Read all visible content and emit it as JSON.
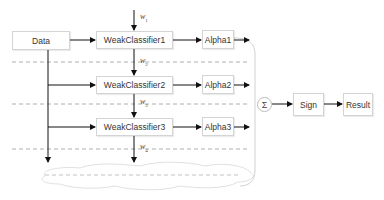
{
  "diagram": {
    "nodes": {
      "data": "Data",
      "weak1": "WeakClassifier1",
      "weak2": "WeakClassifier2",
      "weak3": "WeakClassifier3",
      "alpha1": "Alpha1",
      "alpha2": "Alpha2",
      "alpha3": "Alpha3",
      "sum": "Σ",
      "sign": "Sign",
      "result": "Result"
    },
    "weights": {
      "w1": {
        "symbol": "w",
        "sub": "1"
      },
      "w2": {
        "symbol": "w",
        "sub": "2"
      },
      "w3": {
        "symbol": "w",
        "sub": "3"
      },
      "w4": {
        "symbol": "w",
        "sub": "4"
      }
    },
    "colors": {
      "arrow": "#111111",
      "box_border": "#d4d4d4",
      "dashed": "#999999",
      "bracket": "#cccccc"
    }
  }
}
